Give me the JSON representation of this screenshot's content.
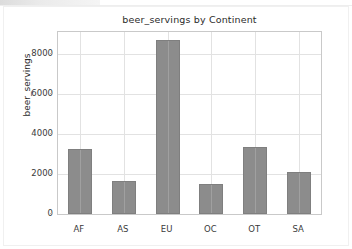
{
  "figure": {
    "background_color": "#ffffff",
    "frame_color": "#c9c9c9",
    "grid_color": "#e2e2e2",
    "bar_color": "#8c8c8c",
    "bar_edge_color": "#7f7f7f"
  },
  "chart_data": {
    "type": "bar",
    "title": "beer_servings by Continent",
    "xlabel": "",
    "ylabel": "beer_servings",
    "categories": [
      "AF",
      "AS",
      "EU",
      "OC",
      "OT",
      "SA"
    ],
    "values": [
      3258,
      1630,
      8720,
      1496,
      3345,
      2101
    ],
    "yticks": [
      0,
      2000,
      4000,
      6000,
      8000
    ],
    "ytick_labels": [
      "0",
      "2000",
      "4000",
      "6000",
      "8000"
    ],
    "ylim": [
      0,
      9100
    ],
    "grid": true,
    "legend": null,
    "legend_position": "none"
  }
}
